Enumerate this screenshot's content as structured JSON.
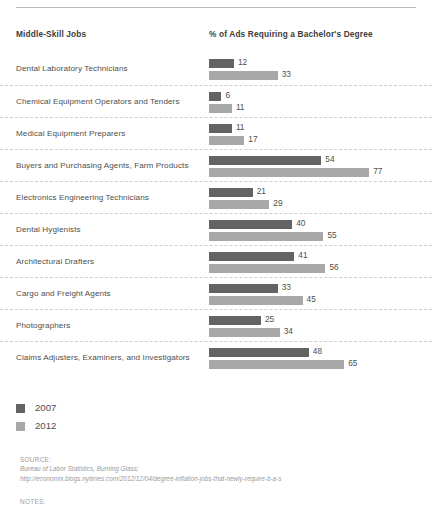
{
  "header": {
    "left_column_title": "Middle-Skill Jobs",
    "right_column_title": "% of Ads Requiring a Bachelor's Degree"
  },
  "legend": {
    "items": [
      {
        "label": "2007",
        "color": "#636363",
        "swatch_name": "legend-swatch-2007"
      },
      {
        "label": "2012",
        "color": "#a8a8a8",
        "swatch_name": "legend-swatch-2012"
      }
    ]
  },
  "source": {
    "title": "SOURCE:",
    "lines": [
      "Bureau of Labor Statistics, Burning Glass;",
      "http://economix.blogs.nytimes.com/2012/12/04/degree-inflation-jobs-that-newly-require-b-a-s"
    ]
  },
  "notes": {
    "title": "NOTES:"
  },
  "chart_data": {
    "type": "bar",
    "orientation": "horizontal",
    "title": "",
    "xlabel": "% of Ads Requiring a Bachelor's Degree",
    "ylabel": "Middle-Skill Jobs",
    "xlim": [
      0,
      80
    ],
    "grid": false,
    "legend_position": "bottom-left",
    "value_labels": true,
    "categories": [
      "Dental Laboratory Technicians",
      "Chemical Equipment Operators and Tenders",
      "Medical Equipment Preparers",
      "Buyers and Purchasing Agents, Farm Products",
      "Electronics Engineering Technicians",
      "Dental Hygienists",
      "Architectural Drafters",
      "Cargo and Freight Agents",
      "Photographers",
      "Claims Adjusters, Examiners, and Investigators"
    ],
    "series": [
      {
        "name": "2007",
        "color": "#636363",
        "values": [
          12,
          6,
          11,
          54,
          21,
          40,
          41,
          33,
          25,
          48
        ]
      },
      {
        "name": "2012",
        "color": "#a8a8a8",
        "values": [
          33,
          11,
          17,
          77,
          29,
          55,
          56,
          45,
          34,
          65
        ]
      }
    ]
  }
}
